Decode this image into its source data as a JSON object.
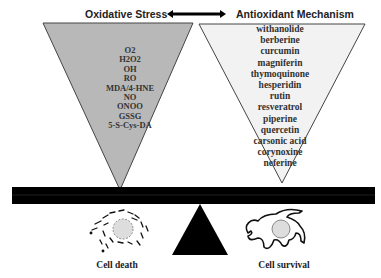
{
  "diagram": {
    "type": "balance-scale",
    "left_panel": {
      "title": "Oxidative Stress",
      "fill_color": "#b8b8b8",
      "items": [
        "O2",
        "H2O2",
        "OH",
        "RO",
        "MDA/4-HNE",
        "NO",
        "ONOO",
        "GSSG",
        "5-S-Cys-DA"
      ]
    },
    "right_panel": {
      "title": "Antioxidant Mechanism",
      "fill_color": "#f2f2f2",
      "items": [
        "withanolide",
        "berberine",
        "curcumin",
        "magniferin",
        "thymoquinone",
        "hesperidin",
        "rutin",
        "resveratrol",
        "piperine",
        "quercetin",
        "carsonic acid",
        "corynoxine",
        "neferine"
      ]
    },
    "connector": "double-headed-arrow",
    "beam_color": "#000000",
    "fulcrum_color": "#000000",
    "outcomes": {
      "left": {
        "label": "Cell death"
      },
      "right": {
        "label": "Cell survival"
      }
    }
  }
}
